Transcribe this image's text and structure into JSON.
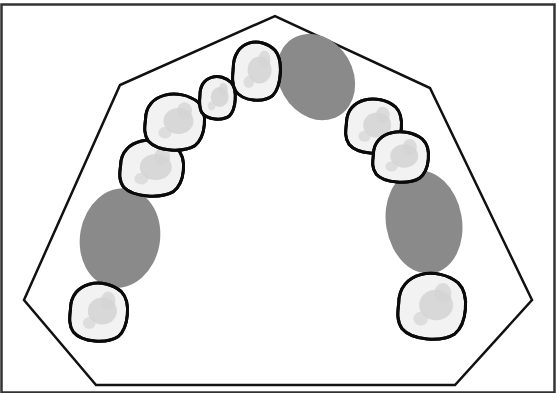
{
  "diagram": {
    "title": "",
    "colors": {
      "background": "#ffffff",
      "frame": "#333333",
      "arch_outline": "#111111",
      "tooth_outline": "#0a0a0a",
      "tooth_fill": "#f2f2f2",
      "tooth_shade": "#d4d4d4",
      "gap": "#8a8a8a"
    },
    "arch_outline_points": [
      [
        96,
        385
      ],
      [
        24,
        300
      ],
      [
        120,
        85
      ],
      [
        275,
        16
      ],
      [
        430,
        88
      ],
      [
        532,
        300
      ],
      [
        455,
        385
      ]
    ],
    "teeth": [
      {
        "id": "left-molar",
        "side": "left",
        "cx": 98,
        "cy": 311,
        "rx": 29,
        "ry": 30
      },
      {
        "id": "left-premolar-2",
        "side": "left",
        "cx": 151,
        "cy": 167,
        "rx": 32,
        "ry": 29
      },
      {
        "id": "left-premolar-1",
        "side": "left",
        "cx": 174,
        "cy": 121,
        "rx": 30,
        "ry": 29
      },
      {
        "id": "left-lateral-incisor",
        "side": "left",
        "cx": 217,
        "cy": 97,
        "rx": 18,
        "ry": 22
      },
      {
        "id": "left-central-incisor",
        "side": "left",
        "cx": 256,
        "cy": 70,
        "rx": 24,
        "ry": 30
      },
      {
        "id": "right-premolar-1",
        "side": "right",
        "cx": 373,
        "cy": 125,
        "rx": 28,
        "ry": 28
      },
      {
        "id": "right-premolar-2",
        "side": "right",
        "cx": 400,
        "cy": 156,
        "rx": 28,
        "ry": 26
      },
      {
        "id": "right-molar",
        "side": "right",
        "cx": 431,
        "cy": 305,
        "rx": 34,
        "ry": 34
      }
    ],
    "gaps": [
      {
        "id": "right-central-gap",
        "cx": 316,
        "cy": 77,
        "rx": 37,
        "ry": 45,
        "rotate": -30
      },
      {
        "id": "left-posterior-gap",
        "cx": 120,
        "cy": 238,
        "rx": 40,
        "ry": 50,
        "rotate": 10
      },
      {
        "id": "right-posterior-gap",
        "cx": 424,
        "cy": 222,
        "rx": 38,
        "ry": 52,
        "rotate": -10
      }
    ]
  }
}
